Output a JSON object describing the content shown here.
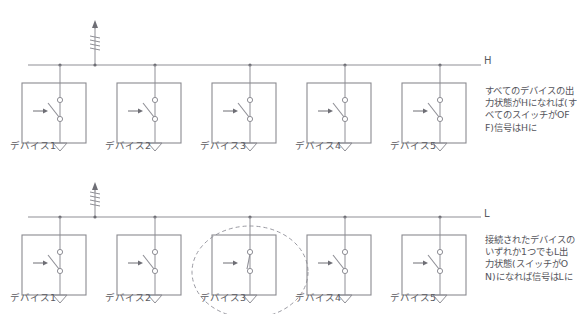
{
  "diagram": {
    "sections": [
      {
        "id": "top",
        "rail_label": "H",
        "pullup": {
          "symbol": "resistor",
          "name": "pull-up-resistor"
        },
        "note": "すべてのデバイスの出力状態がHになれば(すべてのスイッチがOFF)信号はHに",
        "devices": [
          {
            "label": "デバイス1",
            "switch_state": "OFF"
          },
          {
            "label": "デバイス2",
            "switch_state": "OFF"
          },
          {
            "label": "デバイス3",
            "switch_state": "OFF"
          },
          {
            "label": "デバイス4",
            "switch_state": "OFF"
          },
          {
            "label": "デバイス5",
            "switch_state": "OFF"
          }
        ],
        "highlighted_device_index": null
      },
      {
        "id": "bottom",
        "rail_label": "L",
        "pullup": {
          "symbol": "resistor",
          "name": "pull-up-resistor"
        },
        "note": "接続されたデバイスのいずれか1つでもL出力状態(スイッチがON)になれば信号はLに",
        "devices": [
          {
            "label": "デバイス1",
            "switch_state": "OFF"
          },
          {
            "label": "デバイス2",
            "switch_state": "OFF"
          },
          {
            "label": "デバイス3",
            "switch_state": "ON"
          },
          {
            "label": "デバイス4",
            "switch_state": "OFF"
          },
          {
            "label": "デバイス5",
            "switch_state": "OFF"
          }
        ],
        "highlighted_device_index": 2
      }
    ],
    "colors": {
      "line": "#8f8f96",
      "box": "#8a8a90",
      "text": "#55555c",
      "highlight": "#9a9aa2",
      "background": "#ffffff"
    }
  }
}
